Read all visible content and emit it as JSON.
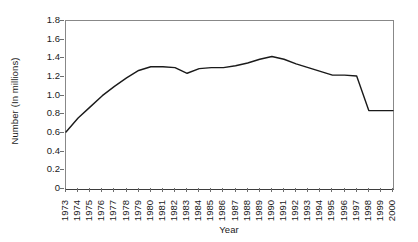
{
  "chart_data": {
    "type": "line",
    "title": "",
    "xlabel": "Year",
    "ylabel": "Number (In millions)",
    "ylim": [
      0,
      1.8
    ],
    "yticks": [
      "0",
      "0.2",
      "0.4",
      "0.6",
      "0.8",
      "1.0",
      "1.2",
      "1.4",
      "1.6",
      "1.8"
    ],
    "ytick_values": [
      0,
      0.2,
      0.4,
      0.6,
      0.8,
      1.0,
      1.2,
      1.4,
      1.6,
      1.8
    ],
    "grid": false,
    "legend": false,
    "legend_position": "none",
    "line_color": "#1a1a1a",
    "categories": [
      "1973",
      "1974",
      "1975",
      "1976",
      "1977",
      "1978",
      "1979",
      "1980",
      "1981",
      "1982",
      "1983",
      "1984",
      "1985",
      "1986",
      "1987",
      "1988",
      "1989",
      "1990",
      "1991",
      "1992",
      "1993",
      "1994",
      "1995",
      "1996",
      "1997",
      "1998",
      "1999",
      "2000"
    ],
    "x": [
      1973,
      1974,
      1975,
      1976,
      1977,
      1978,
      1979,
      1980,
      1981,
      1982,
      1983,
      1984,
      1985,
      1986,
      1987,
      1988,
      1989,
      1990,
      1991,
      1992,
      1993,
      1994,
      1995,
      1996,
      1997,
      1998,
      1999,
      2000
    ],
    "values": [
      0.61,
      0.76,
      0.88,
      1.0,
      1.1,
      1.19,
      1.27,
      1.31,
      1.31,
      1.3,
      1.24,
      1.29,
      1.3,
      1.3,
      1.32,
      1.35,
      1.39,
      1.42,
      1.39,
      1.34,
      1.3,
      1.26,
      1.22,
      1.22,
      1.21,
      0.84,
      0.84,
      0.84
    ],
    "series": [
      {
        "name": "Number (In millions)",
        "values": [
          0.61,
          0.76,
          0.88,
          1.0,
          1.1,
          1.19,
          1.27,
          1.31,
          1.31,
          1.3,
          1.24,
          1.29,
          1.3,
          1.3,
          1.32,
          1.35,
          1.39,
          1.42,
          1.39,
          1.34,
          1.3,
          1.26,
          1.22,
          1.22,
          1.21,
          0.84,
          0.84,
          0.84
        ]
      }
    ]
  }
}
